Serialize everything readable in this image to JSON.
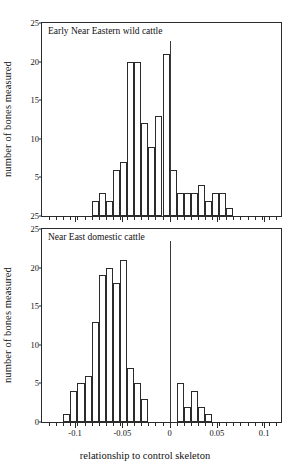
{
  "figure": {
    "xlabel": "relationship to control skeleton",
    "ylabel_top": "number of bones measured",
    "ylabel_bottom": "number of bones measured"
  },
  "chart_data": [
    {
      "type": "bar",
      "title": "Early Near Eastern wild cattle",
      "xlabel": "relationship to control skeleton",
      "ylabel": "number of bones measured",
      "xlim": [
        -0.135,
        0.12
      ],
      "ylim": [
        0,
        25
      ],
      "xticks": [
        -0.1,
        -0.05,
        0,
        0.05,
        0.1
      ],
      "xticklabels": [
        "-0.1",
        "-0.05",
        "0",
        "0.05",
        "0.1"
      ],
      "yticks": [
        0,
        5,
        10,
        15,
        20,
        25
      ],
      "yticklabels": [
        "25",
        "5",
        "10",
        "15",
        "20",
        "25"
      ],
      "grid": false,
      "binwidth": 0.0075,
      "bins": [
        -0.0825,
        -0.075,
        -0.0675,
        -0.06,
        -0.0525,
        -0.045,
        -0.0375,
        -0.03,
        -0.0225,
        -0.015,
        -0.0075,
        0,
        0.0075,
        0.015,
        0.0225,
        0.03,
        0.0375,
        0.045,
        0.0525,
        0.06
      ],
      "values": [
        2,
        3,
        2,
        6,
        7,
        20,
        20,
        12,
        9,
        13,
        21,
        6,
        3,
        3,
        3,
        4,
        2,
        3,
        3,
        1
      ],
      "annotations": [
        {
          "type": "vline",
          "x": 0,
          "label": "control skeleton reference"
        }
      ]
    },
    {
      "type": "bar",
      "title": "Near East domestic cattle",
      "xlabel": "relationship to control skeleton",
      "ylabel": "number of bones measured",
      "xlim": [
        -0.135,
        0.12
      ],
      "ylim": [
        0,
        25
      ],
      "xticks": [
        -0.1,
        -0.05,
        0,
        0.05,
        0.1
      ],
      "xticklabels": [
        "-0.1",
        "-0.05",
        "0",
        "0.05",
        "0.1"
      ],
      "yticks": [
        0,
        5,
        10,
        15,
        20,
        25
      ],
      "yticklabels": [
        "0",
        "5",
        "10",
        "15",
        "20",
        "25"
      ],
      "grid": false,
      "binwidth": 0.0075,
      "bins": [
        -0.1125,
        -0.105,
        -0.0975,
        -0.09,
        -0.0825,
        -0.075,
        -0.0675,
        -0.06,
        -0.0525,
        -0.045,
        -0.0375,
        -0.03,
        -0.0225,
        -0.015,
        -0.0075,
        0.0075,
        0.015,
        0.0225,
        0.03,
        0.0375,
        0.045
      ],
      "values": [
        1,
        4,
        5,
        6,
        13,
        19,
        20,
        18,
        21,
        7,
        5,
        3,
        0,
        0,
        0,
        5,
        2,
        4,
        2,
        1,
        0
      ],
      "annotations": [
        {
          "type": "vline",
          "x": 0,
          "label": "control skeleton reference"
        }
      ]
    }
  ]
}
